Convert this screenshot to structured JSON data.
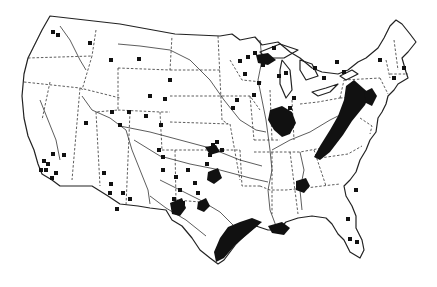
{
  "map": {
    "title": "",
    "subject": "United States point-location map",
    "colors": {
      "background": "#ffffff",
      "ink": "#111111"
    },
    "marker_symbol": "filled-square",
    "regions_with_dense_markers": [
      "Appalachian belt (PA–WV–KY–TN)",
      "Illinois basin",
      "Texas Gulf Coast",
      "Louisiana coast",
      "Oklahoma / North Texas",
      "West Texas Permian area",
      "Upper Michigan / Wisconsin",
      "Alabama",
      "Upstate New York / New England"
    ],
    "points": [
      [
        53,
        32
      ],
      [
        58,
        35
      ],
      [
        90,
        43
      ],
      [
        111,
        60
      ],
      [
        139,
        59
      ],
      [
        170,
        80
      ],
      [
        165,
        99
      ],
      [
        150,
        96
      ],
      [
        146,
        116
      ],
      [
        129,
        112
      ],
      [
        112,
        112
      ],
      [
        86,
        123
      ],
      [
        120,
        125
      ],
      [
        161,
        125
      ],
      [
        44,
        161
      ],
      [
        48,
        164
      ],
      [
        53,
        154
      ],
      [
        64,
        155
      ],
      [
        41,
        170
      ],
      [
        46,
        170
      ],
      [
        52,
        178
      ],
      [
        56,
        173
      ],
      [
        104,
        173
      ],
      [
        111,
        184
      ],
      [
        110,
        193
      ],
      [
        123,
        193
      ],
      [
        130,
        199
      ],
      [
        117,
        209
      ],
      [
        159,
        150
      ],
      [
        163,
        157
      ],
      [
        163,
        170
      ],
      [
        176,
        177
      ],
      [
        180,
        190
      ],
      [
        174,
        199
      ],
      [
        183,
        203
      ],
      [
        195,
        183
      ],
      [
        198,
        193
      ],
      [
        188,
        170
      ],
      [
        207,
        164
      ],
      [
        210,
        155
      ],
      [
        213,
        145
      ],
      [
        217,
        142
      ],
      [
        222,
        150
      ],
      [
        233,
        108
      ],
      [
        237,
        100
      ],
      [
        240,
        61
      ],
      [
        245,
        74
      ],
      [
        254,
        95
      ],
      [
        248,
        57
      ],
      [
        255,
        53
      ],
      [
        263,
        65
      ],
      [
        259,
        83
      ],
      [
        274,
        48
      ],
      [
        279,
        76
      ],
      [
        286,
        73
      ],
      [
        294,
        98
      ],
      [
        290,
        108
      ],
      [
        315,
        68
      ],
      [
        324,
        78
      ],
      [
        337,
        62
      ],
      [
        344,
        72
      ],
      [
        380,
        60
      ],
      [
        394,
        78
      ],
      [
        404,
        68
      ],
      [
        356,
        190
      ],
      [
        357,
        242
      ],
      [
        350,
        239
      ],
      [
        348,
        219
      ]
    ],
    "clusters": [
      {
        "name": "appalachian",
        "poly": [
          [
            346,
            86
          ],
          [
            354,
            80
          ],
          [
            363,
            88
          ],
          [
            370,
            94
          ],
          [
            365,
            105
          ],
          [
            352,
            121
          ],
          [
            343,
            135
          ],
          [
            330,
            152
          ],
          [
            320,
            160
          ],
          [
            314,
            157
          ],
          [
            320,
            146
          ],
          [
            330,
            130
          ],
          [
            338,
            116
          ],
          [
            344,
            100
          ]
        ]
      },
      {
        "name": "pa-east",
        "poly": [
          [
            364,
            92
          ],
          [
            372,
            88
          ],
          [
            377,
            96
          ],
          [
            372,
            106
          ],
          [
            366,
            103
          ]
        ]
      },
      {
        "name": "illinois-basin",
        "poly": [
          [
            270,
            110
          ],
          [
            282,
            106
          ],
          [
            292,
            112
          ],
          [
            296,
            123
          ],
          [
            290,
            134
          ],
          [
            282,
            137
          ],
          [
            274,
            130
          ],
          [
            268,
            120
          ]
        ]
      },
      {
        "name": "michigan-up",
        "poly": [
          [
            256,
            55
          ],
          [
            268,
            53
          ],
          [
            276,
            60
          ],
          [
            268,
            65
          ],
          [
            258,
            63
          ]
        ]
      },
      {
        "name": "alabama",
        "poly": [
          [
            296,
            181
          ],
          [
            306,
            178
          ],
          [
            310,
            186
          ],
          [
            304,
            193
          ],
          [
            296,
            190
          ]
        ]
      },
      {
        "name": "tx-gulf",
        "poly": [
          [
            228,
            227
          ],
          [
            240,
            222
          ],
          [
            252,
            218
          ],
          [
            262,
            222
          ],
          [
            248,
            234
          ],
          [
            236,
            244
          ],
          [
            224,
            258
          ],
          [
            216,
            262
          ],
          [
            214,
            252
          ],
          [
            220,
            238
          ]
        ]
      },
      {
        "name": "la-coast",
        "poly": [
          [
            268,
            226
          ],
          [
            282,
            222
          ],
          [
            290,
            228
          ],
          [
            284,
            235
          ],
          [
            272,
            233
          ]
        ]
      },
      {
        "name": "permian",
        "poly": [
          [
            170,
            203
          ],
          [
            182,
            198
          ],
          [
            186,
            208
          ],
          [
            180,
            216
          ],
          [
            172,
            214
          ]
        ]
      },
      {
        "name": "oklahoma",
        "poly": [
          [
            208,
            172
          ],
          [
            218,
            168
          ],
          [
            222,
            178
          ],
          [
            214,
            184
          ],
          [
            207,
            180
          ]
        ]
      },
      {
        "name": "n-texas",
        "poly": [
          [
            198,
            202
          ],
          [
            206,
            198
          ],
          [
            210,
            206
          ],
          [
            204,
            212
          ],
          [
            197,
            209
          ]
        ]
      },
      {
        "name": "kansas",
        "poly": [
          [
            205,
            147
          ],
          [
            216,
            145
          ],
          [
            220,
            152
          ],
          [
            210,
            155
          ]
        ]
      }
    ]
  }
}
